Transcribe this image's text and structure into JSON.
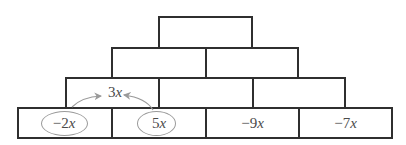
{
  "pyramid": {
    "rows": [
      {
        "row": 1,
        "bricks": [
          {
            "value": ""
          }
        ]
      },
      {
        "row": 2,
        "bricks": [
          {
            "value": ""
          },
          {
            "value": ""
          }
        ]
      },
      {
        "row": 3,
        "bricks": [
          {
            "value": "3x"
          },
          {
            "value": ""
          },
          {
            "value": ""
          }
        ]
      },
      {
        "row": 4,
        "bricks": [
          {
            "value": "−2x"
          },
          {
            "value": "5x"
          },
          {
            "value": "−9x"
          },
          {
            "value": "−7x"
          }
        ]
      }
    ],
    "annotation": {
      "circled": [
        "−2x",
        "5x"
      ],
      "arrows_to": "3x",
      "arrow_color": "#9a9a9a"
    }
  }
}
